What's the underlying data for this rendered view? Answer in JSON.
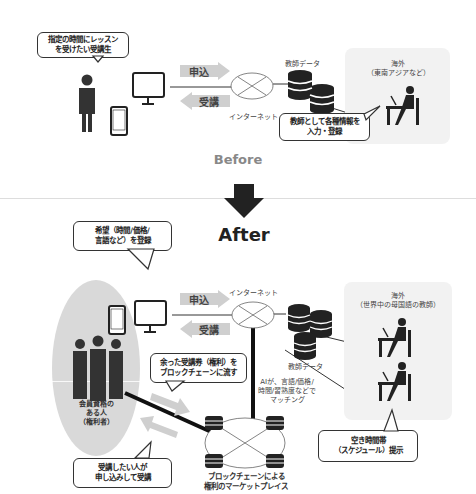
{
  "before": {
    "student_bubble": "指定の時間にレッスン\nを受けたい受講生",
    "apply_label": "申込",
    "attend_label": "受講",
    "internet_label": "インターネット",
    "teacher_data_label": "教師データ",
    "overseas_label": "海外\n（東南アジアなど）",
    "teacher_bubble": "教師として各種情報を\n入力・登録",
    "section_label": "Before"
  },
  "after": {
    "section_label": "After",
    "wish_bubble": "希望（時間/価格/\n言語など）を登録",
    "apply_label": "申込",
    "attend_label": "受講",
    "internet_label": "インターネット",
    "teacher_data_label": "教師データ",
    "overseas_label": "海外\n（世界中の母国語の教師）",
    "surplus_bubble": "余った受講券（権利）を\nブロックチェーンに流す",
    "ai_label": "AIが、言語/価格/\n時間/習熟度などで\nマッチング",
    "member_label": "会員資格の\nある人\n（権利者）",
    "buyer_bubble": "受講したい人が\n申し込みして受講",
    "schedule_bubble": "空き時間帯\n（スケジュール）提示",
    "marketplace_label": "ブロックチェーンによる\n権利のマーケットプレイス"
  },
  "colors": {
    "dark": "#333333",
    "arrow_gray": "#cfcfcf",
    "panel_gray": "#f2f2f2",
    "oval_gray": "#d9d9d9"
  }
}
